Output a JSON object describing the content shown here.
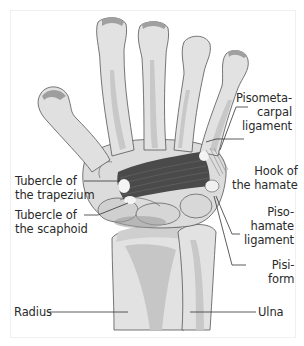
{
  "figure": {
    "colors": {
      "bone_fill": "#e4e4e4",
      "bone_shade": "#c2c2c2",
      "bone_dark": "#9e9e9e",
      "outline": "#555555",
      "ligament": "#4a4a4a",
      "leader_line": "#333333",
      "text": "#2a2a2a"
    }
  },
  "labels": {
    "pisometacarpal": {
      "line1": "Pisometa-",
      "line2": "carpal",
      "line3": "ligament"
    },
    "hook_hamate": {
      "line1": "Hook of",
      "line2": "the hamate"
    },
    "tubercle_trapezium": {
      "line1": "Tubercle of",
      "line2": "the trapezium"
    },
    "tubercle_scaphoid": {
      "line1": "Tubercle of",
      "line2": "the scaphoid"
    },
    "pisohamate": {
      "line1": "Piso-",
      "line2": "hamate",
      "line3": "ligament"
    },
    "pisiform": {
      "line1": "Pisi-",
      "line2": "form"
    },
    "radius": {
      "line1": "Radius"
    },
    "ulna": {
      "line1": "Ulna"
    }
  }
}
